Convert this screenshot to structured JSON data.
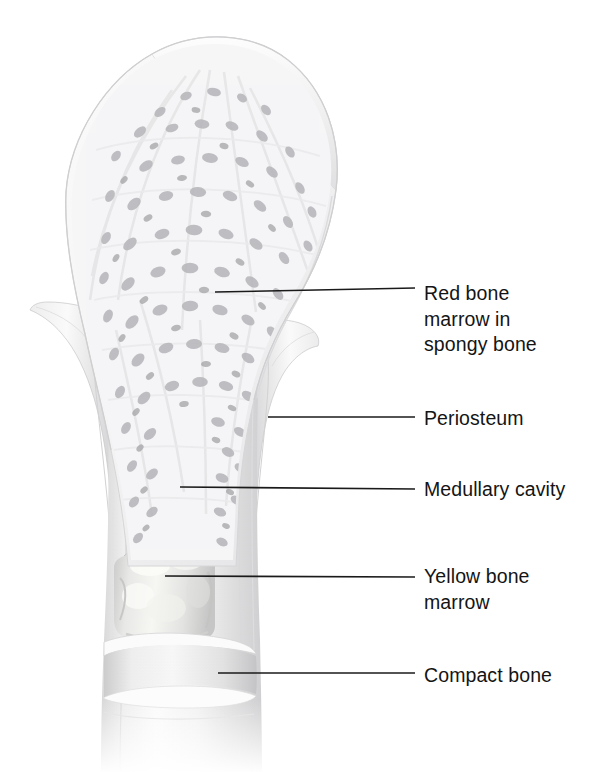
{
  "figure": {
    "background_color": "#ffffff",
    "label_text_color": "#141414",
    "leader_line_color": "#1a1a1a"
  },
  "labels": [
    {
      "id": "red-bone-marrow",
      "text": "Red bone\nmarrow in\nspongy bone",
      "x": 424,
      "y": 281,
      "leader": {
        "x1": 215,
        "y1": 292,
        "x2": 415,
        "y2": 288
      }
    },
    {
      "id": "periosteum",
      "text": "Periosteum",
      "x": 424,
      "y": 406,
      "leader": {
        "x1": 268,
        "y1": 417,
        "x2": 415,
        "y2": 417
      }
    },
    {
      "id": "medullary-cavity",
      "text": "Medullary cavity",
      "x": 424,
      "y": 477,
      "leader": {
        "x1": 180,
        "y1": 487,
        "x2": 415,
        "y2": 489
      }
    },
    {
      "id": "yellow-bone-marrow",
      "text": "Yellow bone\nmarrow",
      "x": 424,
      "y": 564,
      "leader": {
        "x1": 165,
        "y1": 576,
        "x2": 415,
        "y2": 577
      }
    },
    {
      "id": "compact-bone",
      "text": "Compact bone",
      "x": 424,
      "y": 663,
      "leader": {
        "x1": 218,
        "y1": 673,
        "x2": 415,
        "y2": 673
      }
    }
  ],
  "structures": {
    "epiphysis": "bulbous bone head at top filled with spongy trabecular bone",
    "articular_cartilage": "thin pale cap over the top of the bone head",
    "spongy_bone": "lattice of fine trabeculae with dark marrow spaces",
    "periosteum_flaps": "two pale membrane sheets peeled away from shaft sides",
    "medullary_cavity": "dark tapering column in the center of the shaft",
    "yellow_marrow": "lumpy pale cylinder inside lower medullary cavity",
    "compact_bone": "dense smooth outer wall of the shaft, cut as stacked cuffs",
    "diaphysis": "cylindrical shaft fading out at the bottom of the image"
  }
}
